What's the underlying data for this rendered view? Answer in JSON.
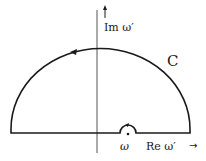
{
  "diagram": {
    "type": "contour-integral",
    "labels": {
      "imaginary_axis": "Im ω′",
      "real_axis": "Re ω′",
      "contour": "C",
      "pole": "ω"
    },
    "arrows": {
      "imaginary_axis": "↑",
      "real_axis": "→"
    },
    "colors": {
      "stroke": "#1a1a1a",
      "axis": "#555555",
      "background": "#ffffff"
    }
  }
}
